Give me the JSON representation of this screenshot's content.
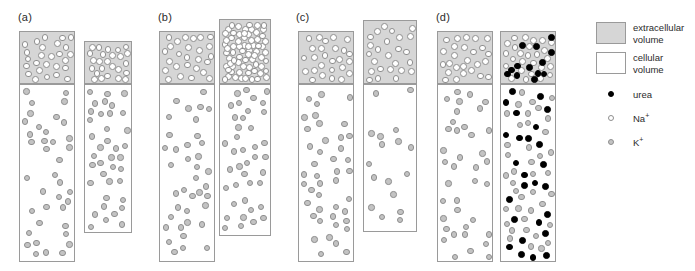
{
  "figure": {
    "width": 695,
    "height": 271,
    "background": "#ffffff"
  },
  "colors": {
    "extracellular_fill": "#d6d6d6",
    "cellular_fill": "#ffffff",
    "box_stroke": "#9a9a9a",
    "na_fill": "#ffffff",
    "na_stroke": "#8e8e8e",
    "k_fill": "#c3c3c3",
    "k_stroke": "#8e8e8e",
    "urea_fill": "#000000",
    "text": "#2b2b2b"
  },
  "panels": [
    {
      "id": "a",
      "label": "(a)",
      "label_x": 18,
      "label_y": 12,
      "columns": [
        {
          "name": "left",
          "x": 19,
          "width": 56,
          "compartments": [
            {
              "type": "extracellular",
              "y": 31,
              "height": 53,
              "particle": "na",
              "count": 26,
              "radius": 3.4,
              "seed": 11
            },
            {
              "type": "cellular",
              "y": 84,
              "height": 178,
              "particle": "k",
              "count": 38,
              "radius": 3.2,
              "seed": 12
            }
          ]
        },
        {
          "name": "right",
          "x": 84,
          "width": 48,
          "compartments": [
            {
              "type": "extracellular",
              "y": 41,
              "height": 43,
              "particle": "na",
              "count": 25,
              "radius": 3.4,
              "seed": 13
            },
            {
              "type": "cellular",
              "y": 84,
              "height": 149,
              "particle": "k",
              "count": 38,
              "radius": 3.2,
              "seed": 14
            }
          ]
        }
      ]
    },
    {
      "id": "b",
      "label": "(b)",
      "label_x": 158,
      "label_y": 12,
      "columns": [
        {
          "name": "left",
          "x": 159,
          "width": 56,
          "compartments": [
            {
              "type": "extracellular",
              "y": 31,
              "height": 53,
              "particle": "na",
              "count": 26,
              "radius": 3.4,
              "seed": 21
            },
            {
              "type": "cellular",
              "y": 84,
              "height": 178,
              "particle": "k",
              "count": 38,
              "radius": 3.2,
              "seed": 22
            }
          ]
        },
        {
          "name": "right",
          "x": 219,
          "width": 52,
          "compartments": [
            {
              "type": "extracellular",
              "y": 19,
              "height": 65,
              "particle": "na",
              "count": 70,
              "radius": 3.4,
              "seed": 23
            },
            {
              "type": "cellular",
              "y": 84,
              "height": 152,
              "particle": "k",
              "count": 40,
              "radius": 3.2,
              "seed": 24
            }
          ]
        }
      ]
    },
    {
      "id": "c",
      "label": "(c)",
      "label_x": 296,
      "label_y": 12,
      "columns": [
        {
          "name": "left",
          "x": 298,
          "width": 56,
          "compartments": [
            {
              "type": "extracellular",
              "y": 31,
              "height": 53,
              "particle": "na",
              "count": 26,
              "radius": 3.4,
              "seed": 31
            },
            {
              "type": "cellular",
              "y": 84,
              "height": 178,
              "particle": "k",
              "count": 43,
              "radius": 3.2,
              "seed": 32
            }
          ]
        },
        {
          "name": "right",
          "x": 363,
          "width": 54,
          "compartments": [
            {
              "type": "extracellular",
              "y": 20,
              "height": 64,
              "particle": "na",
              "count": 25,
              "radius": 3.4,
              "seed": 33
            },
            {
              "type": "cellular",
              "y": 84,
              "height": 148,
              "particle": "k",
              "count": 17,
              "radius": 3.2,
              "seed": 34
            }
          ]
        }
      ]
    },
    {
      "id": "d",
      "label": "(d)",
      "label_x": 436,
      "label_y": 12,
      "columns": [
        {
          "name": "left",
          "x": 437,
          "width": 56,
          "compartments": [
            {
              "type": "extracellular",
              "y": 31,
              "height": 53,
              "particle": "na",
              "count": 26,
              "radius": 3.4,
              "seed": 41
            },
            {
              "type": "cellular",
              "y": 84,
              "height": 178,
              "particle": "k",
              "count": 38,
              "radius": 3.2,
              "seed": 42
            }
          ]
        },
        {
          "name": "right",
          "x": 500,
          "width": 56,
          "compartments": [
            {
              "type": "extracellular",
              "y": 31,
              "height": 53,
              "particle": "na",
              "count": 26,
              "radius": 3.4,
              "seed": 43,
              "extra": {
                "particle": "urea",
                "count": 13,
                "radius": 3.4,
                "seed": 44
              }
            },
            {
              "type": "cellular",
              "y": 84,
              "height": 178,
              "particle": "k",
              "count": 40,
              "radius": 3.2,
              "seed": 45,
              "extra": {
                "particle": "urea",
                "count": 26,
                "radius": 3.4,
                "seed": 46
              }
            }
          ]
        }
      ]
    }
  ],
  "legend": {
    "swatches": [
      {
        "key": "extracellular",
        "label": "extracellular volume"
      },
      {
        "key": "cellular",
        "label": "cellular volume"
      }
    ],
    "markers": [
      {
        "key": "urea",
        "label": "urea",
        "charge": ""
      },
      {
        "key": "na",
        "label": "Na",
        "charge": "+"
      },
      {
        "key": "k",
        "label": "K",
        "charge": "+"
      }
    ]
  }
}
